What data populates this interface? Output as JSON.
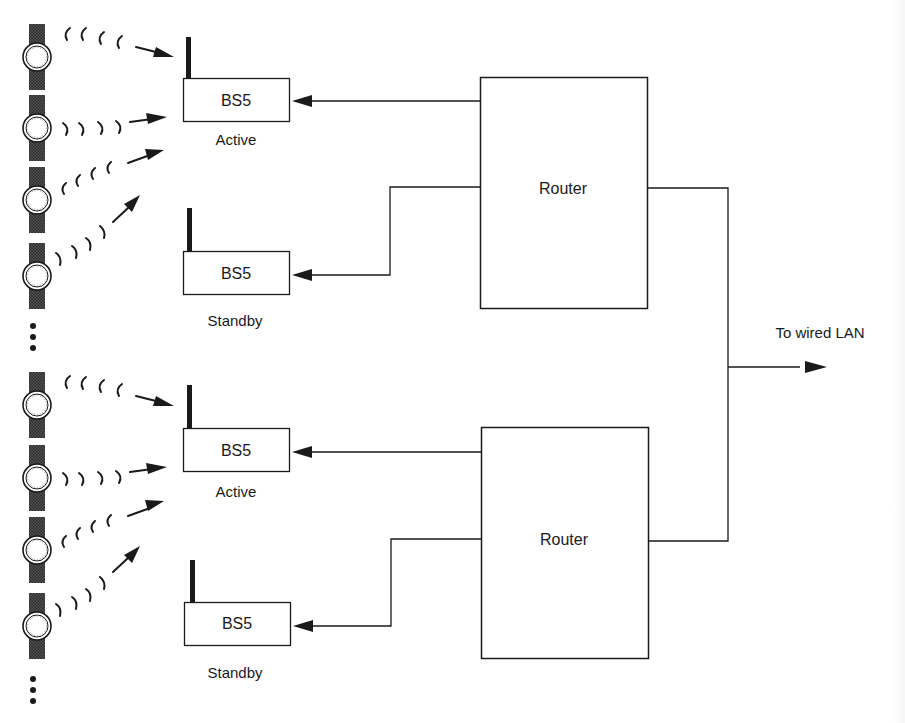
{
  "diagram": {
    "type": "network-topology",
    "colors": {
      "line": "#1a1a1a",
      "background": "#ffffff",
      "watch_band": "#3a3a3a"
    },
    "routers": [
      {
        "id": "router-top",
        "label": "Router"
      },
      {
        "id": "router-bottom",
        "label": "Router"
      }
    ],
    "base_stations": [
      {
        "id": "bs-top-active",
        "label": "BS5",
        "status": "Active"
      },
      {
        "id": "bs-top-standby",
        "label": "BS5",
        "status": "Standby"
      },
      {
        "id": "bs-bottom-active",
        "label": "BS5",
        "status": "Active"
      },
      {
        "id": "bs-bottom-standby",
        "label": "BS5",
        "status": "Standby"
      }
    ],
    "uplink": {
      "label": "To wired LAN"
    },
    "mobile_devices": {
      "icon": "wristwatch-icon",
      "count_per_group": 4,
      "groups": 2,
      "continuation": "vertical-ellipsis"
    },
    "connections": [
      {
        "from": "router-top",
        "to": "bs-top-active"
      },
      {
        "from": "router-top",
        "to": "bs-top-standby"
      },
      {
        "from": "router-bottom",
        "to": "bs-bottom-active"
      },
      {
        "from": "router-bottom",
        "to": "bs-bottom-standby"
      },
      {
        "from": "router-top",
        "to": "wired-lan"
      },
      {
        "from": "router-bottom",
        "to": "wired-lan"
      }
    ]
  }
}
